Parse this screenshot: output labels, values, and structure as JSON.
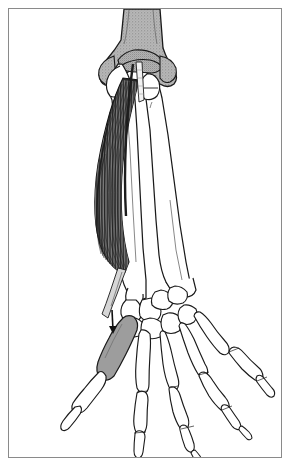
{
  "plate": {
    "subject": "right forearm and hand skeleton, posterior view",
    "title": "Abductor pollicis longus",
    "caption_partial": "",
    "border_color": "#8a8a8a",
    "background_color": "#ffffff"
  },
  "palette": {
    "outline": "#1a1a1a",
    "bone_fill": "#ffffff",
    "humerus_stipple": "#a8a8a8",
    "shaded_bone": "#9a9a9a",
    "muscle_dark": "#2b2b2b",
    "muscle_mid": "#555555",
    "muscle_light": "#8f8f8f",
    "tendon": "#efefef"
  },
  "structures": {
    "humerus": {
      "label": "humerus",
      "shading": "stipple-gray"
    },
    "lateral_epicondyle": {
      "label": "lateral epicondyle"
    },
    "medial_epicondyle": {
      "label": "medial epicondyle"
    },
    "trochlea": {
      "label": "trochlea"
    },
    "olecranon": {
      "label": "olecranon of ulna"
    },
    "ulna": {
      "label": "ulna",
      "shading": "white"
    },
    "radius": {
      "label": "radius",
      "shading": "white"
    },
    "muscle_belly": {
      "label": "abductor pollicis longus belly",
      "texture": "longitudinal striations",
      "fiber_count": 26
    },
    "tendon": {
      "label": "abductor pollicis longus tendon"
    },
    "carpals": {
      "label": "carpal bones",
      "count": 8
    },
    "first_metacarpal": {
      "label": "first metacarpal",
      "shading": "gray insertion"
    },
    "metacarpals": {
      "label": "metacarpals II-V",
      "count": 4
    },
    "phalanges": {
      "label": "phalanges"
    },
    "thumb_phalanges": {
      "label": "thumb phalanges",
      "count": 2
    }
  }
}
